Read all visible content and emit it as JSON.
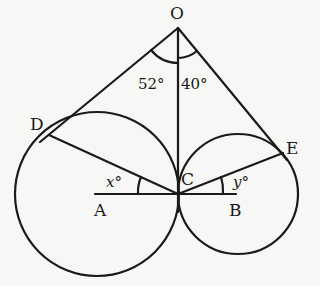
{
  "diagram": {
    "type": "geometry",
    "points": {
      "O": {
        "label": "O",
        "x": 178,
        "y": 28
      },
      "D": {
        "label": "D",
        "x": 48,
        "y": 136
      },
      "E": {
        "label": "E",
        "x": 283,
        "y": 153
      },
      "C": {
        "label": "C",
        "x": 178,
        "y": 194
      },
      "A": {
        "label": "A",
        "x": 97,
        "y": 194
      },
      "B": {
        "label": "B",
        "x": 238,
        "y": 194
      }
    },
    "circles": [
      {
        "name": "circle-A",
        "center": "A",
        "radius": 82
      },
      {
        "name": "circle-B",
        "center": "B",
        "radius": 60
      }
    ],
    "angles": {
      "DOC": {
        "label": "52°",
        "value": 52
      },
      "COE": {
        "label": "40°",
        "value": 40
      },
      "DCA": {
        "label": "x°",
        "variable": "x"
      },
      "ECB": {
        "label": "y°",
        "variable": "y"
      }
    },
    "stroke_color": "#1a1a1a",
    "background_color": "#f7f7f5"
  }
}
